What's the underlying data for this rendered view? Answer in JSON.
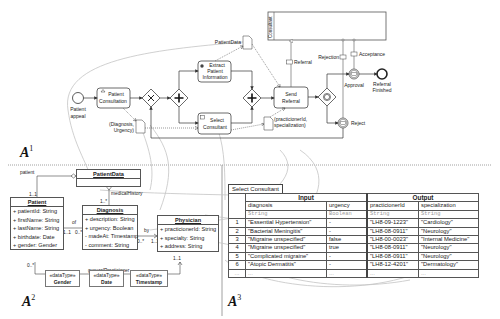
{
  "panels": {
    "a1": {
      "label": "A",
      "sup": "1"
    },
    "a2": {
      "label": "A",
      "sup": "2"
    },
    "a3": {
      "label": "A",
      "sup": "3"
    }
  },
  "bpmn": {
    "pool": {
      "label": "Consultant"
    },
    "start_event": {
      "label_line1": "Patient",
      "label_line2": "appeal"
    },
    "tasks": {
      "patient_consultation": {
        "line1": "Patient",
        "line2": "Consultation"
      },
      "extract_patient_information": {
        "line1": "Extract",
        "line2": "Patient",
        "line3": "Information"
      },
      "select_consultant": {
        "line1": "Select",
        "line2": "Consultant"
      },
      "send_referral": {
        "line1": "Send",
        "line2": "Referral"
      }
    },
    "data_objects": {
      "patient_data": "PatientData",
      "diagnosis_urgency_line1": "(Diagnosis,",
      "diagnosis_urgency_line2": "Urgency)",
      "practitioner_line1": "(practicionerId,",
      "practitioner_line2": "specialization)"
    },
    "messages": {
      "referral": "Referral",
      "rejection": "Rejection",
      "acceptance": "Acceptance"
    },
    "events": {
      "approval": "Approval",
      "reject": "Reject",
      "end_line1": "Referral",
      "end_line2": "Finished"
    }
  },
  "uml": {
    "patient_data": {
      "name": "PatientData"
    },
    "patient": {
      "name": "Patient",
      "attributes": [
        "+ patientId: String",
        "+ firstName: String",
        "+ lastName: String",
        "+ birthdate: Date",
        "+ gender: Gender"
      ]
    },
    "diagnosis": {
      "name": "Diagnosis",
      "attributes": [
        "+ description: String",
        "+ urgency: Boolean",
        "- madeAt: Timestamp",
        "- comment: String"
      ]
    },
    "physician": {
      "name": "Physician",
      "attributes": [
        "+ practicionerId: String",
        "+ specialty: String",
        "+ address: String"
      ]
    },
    "associations": {
      "patient": "patient",
      "medical_history": "medicalHistory",
      "of": "of",
      "by": "by",
      "general_practicioner": "generalPracticioner",
      "mult_1_1": "1..1",
      "mult_0_n": "0..*",
      "mult_1_n": "1..*"
    },
    "datatypes": [
      {
        "stereotype": "«dataType»",
        "name": "Gender"
      },
      {
        "stereotype": "«dataType»",
        "name": "Date"
      },
      {
        "stereotype": "«dataType»",
        "name": "Timestamp"
      }
    ]
  },
  "decision_table": {
    "name": "Select Consultant",
    "input_header": "Input",
    "output_header": "Output",
    "columns": [
      {
        "name": "diagnosis",
        "type": "String"
      },
      {
        "name": "urgency",
        "type": "Boolean"
      },
      {
        "name": "practicionerId",
        "type": "String"
      },
      {
        "name": "specialization",
        "type": "String"
      }
    ],
    "rows": [
      {
        "n": "1",
        "diagnosis": "\"Essential Hypertension\"",
        "urgency": "-",
        "practicionerId": "\"LH8-09-1223\"",
        "specialization": "\"Cardiology\""
      },
      {
        "n": "2",
        "diagnosis": "\"Bacterial Meningitis\"",
        "urgency": "-",
        "practicionerId": "\"LH8-08-0911\"",
        "specialization": "\"Neurology\""
      },
      {
        "n": "3",
        "diagnosis": "\"Migraine unspecified\"",
        "urgency": "false",
        "practicionerId": "\"LH8-00-0023\"",
        "specialization": "\"Internal Medicine\""
      },
      {
        "n": "4",
        "diagnosis": "\"Migraine unspecified\"",
        "urgency": "true",
        "practicionerId": "\"LH8-08-0911\"",
        "specialization": "\"Neurology\""
      },
      {
        "n": "5",
        "diagnosis": "\"Complicated migraine\"",
        "urgency": "-",
        "practicionerId": "\"LH8-08-0911\"",
        "specialization": "\"Neurology\""
      },
      {
        "n": "6",
        "diagnosis": "\"Atopic Dermatitis\"",
        "urgency": "-",
        "practicionerId": "\"LH8-12-4201\"",
        "specialization": "\"Dermatology\""
      },
      {
        "n": "...",
        "diagnosis": "...",
        "urgency": "...",
        "practicionerId": "...",
        "specialization": "..."
      }
    ]
  }
}
